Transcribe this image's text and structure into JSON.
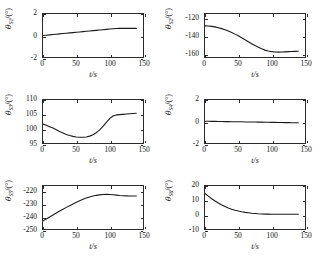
{
  "figure": {
    "rows": 3,
    "cols": 2,
    "xlabel": "t/s",
    "degree_symbol": "°",
    "theta_symbol": "θ"
  },
  "chart_data": [
    {
      "type": "line",
      "id": "theta-s1",
      "title": "",
      "xlabel": "t/s",
      "ylabel": "θS1/(°)",
      "ylabel_base": "θ",
      "ylabel_sub": "S1",
      "ylabel_unit": "/(°)",
      "xlim": [
        0,
        150
      ],
      "ylim": [
        -2,
        2
      ],
      "xticks": [
        0,
        50,
        100,
        150
      ],
      "yticks": [
        2,
        0,
        -2
      ],
      "xtick_labels": [
        "0",
        "50",
        "100",
        "150"
      ],
      "ytick_labels": [
        "2",
        "0",
        "-2"
      ],
      "grid": false,
      "legend": null,
      "x": [
        0,
        5,
        10,
        15,
        20,
        25,
        30,
        35,
        40,
        45,
        50,
        55,
        60,
        65,
        70,
        75,
        80,
        85,
        90,
        95,
        100,
        105,
        110,
        115,
        120,
        125,
        130,
        135,
        140
      ],
      "y": [
        0.0,
        0.03,
        0.06,
        0.09,
        0.12,
        0.15,
        0.18,
        0.21,
        0.24,
        0.27,
        0.3,
        0.33,
        0.36,
        0.39,
        0.42,
        0.45,
        0.48,
        0.51,
        0.54,
        0.57,
        0.6,
        0.63,
        0.65,
        0.66,
        0.66,
        0.66,
        0.66,
        0.66,
        0.66
      ]
    },
    {
      "type": "line",
      "id": "theta-s2",
      "title": "",
      "xlabel": "t/s",
      "ylabel": "θS2/(°)",
      "ylabel_base": "θ",
      "ylabel_sub": "S2",
      "ylabel_unit": "/(°)",
      "xlim": [
        0,
        150
      ],
      "ylim": [
        -165,
        -115
      ],
      "xticks": [
        0,
        50,
        100,
        150
      ],
      "yticks": [
        -120,
        -140,
        -160
      ],
      "xtick_labels": [
        "0",
        "50",
        "100",
        "150"
      ],
      "ytick_labels": [
        "-120",
        "-140",
        "-160"
      ],
      "grid": false,
      "legend": null,
      "x": [
        0,
        5,
        10,
        15,
        20,
        25,
        30,
        35,
        40,
        45,
        50,
        55,
        60,
        65,
        70,
        75,
        80,
        85,
        90,
        95,
        100,
        105,
        110,
        115,
        120,
        125,
        130,
        135,
        140
      ],
      "y": [
        -128.8,
        -129.0,
        -129.4,
        -130.0,
        -130.9,
        -132.0,
        -133.3,
        -134.8,
        -136.5,
        -138.4,
        -140.4,
        -142.6,
        -144.9,
        -147.2,
        -149.5,
        -151.7,
        -153.7,
        -155.5,
        -157.0,
        -158.1,
        -158.8,
        -159.2,
        -159.3,
        -159.2,
        -159.0,
        -158.8,
        -158.6,
        -158.5,
        -158.4
      ]
    },
    {
      "type": "line",
      "id": "theta-s3",
      "title": "",
      "xlabel": "t/s",
      "ylabel": "θS3/(°)",
      "ylabel_base": "θ",
      "ylabel_sub": "S3",
      "ylabel_unit": "/(°)",
      "xlim": [
        0,
        150
      ],
      "ylim": [
        95,
        110
      ],
      "xticks": [
        0,
        50,
        100,
        150
      ],
      "yticks": [
        110,
        105,
        100,
        95
      ],
      "xtick_labels": [
        "0",
        "50",
        "100",
        "150"
      ],
      "ytick_labels": [
        "110",
        "105",
        "100",
        "95"
      ],
      "grid": false,
      "legend": null,
      "x": [
        0,
        5,
        10,
        15,
        20,
        25,
        30,
        35,
        40,
        45,
        50,
        55,
        60,
        65,
        70,
        75,
        80,
        85,
        90,
        95,
        100,
        105,
        110,
        115,
        120,
        125,
        130,
        135,
        140
      ],
      "y": [
        101.6,
        101.2,
        100.7,
        100.2,
        99.6,
        99.0,
        98.5,
        98.0,
        97.6,
        97.3,
        97.1,
        97.0,
        97.0,
        97.1,
        97.4,
        97.9,
        98.6,
        99.6,
        100.8,
        102.2,
        103.5,
        104.4,
        104.8,
        104.9,
        105.0,
        105.1,
        105.2,
        105.3,
        105.4
      ]
    },
    {
      "type": "line",
      "id": "theta-s4",
      "title": "",
      "xlabel": "t/s",
      "ylabel": "θS4/(°)",
      "ylabel_base": "θ",
      "ylabel_sub": "S4",
      "ylabel_unit": "/(°)",
      "xlim": [
        0,
        150
      ],
      "ylim": [
        -2,
        2
      ],
      "xticks": [
        0,
        50,
        100,
        150
      ],
      "yticks": [
        2,
        0,
        -2
      ],
      "xtick_labels": [
        "0",
        "50",
        "100",
        "150"
      ],
      "ytick_labels": [
        "2",
        "0",
        "-2"
      ],
      "grid": false,
      "legend": null,
      "x": [
        0,
        5,
        10,
        15,
        20,
        25,
        30,
        35,
        40,
        45,
        50,
        55,
        60,
        65,
        70,
        75,
        80,
        85,
        90,
        95,
        100,
        105,
        110,
        115,
        120,
        125,
        130,
        135,
        140
      ],
      "y": [
        0.02,
        0.02,
        0.01,
        0.01,
        0.0,
        0.0,
        -0.01,
        -0.01,
        -0.02,
        -0.02,
        -0.03,
        -0.03,
        -0.04,
        -0.04,
        -0.05,
        -0.05,
        -0.06,
        -0.06,
        -0.07,
        -0.07,
        -0.08,
        -0.08,
        -0.09,
        -0.09,
        -0.1,
        -0.1,
        -0.11,
        -0.11,
        -0.12
      ]
    },
    {
      "type": "line",
      "id": "theta-s5",
      "title": "",
      "xlabel": "t/s",
      "ylabel": "θS5/(°)",
      "ylabel_base": "θ",
      "ylabel_sub": "S5",
      "ylabel_unit": "/(°)",
      "xlim": [
        0,
        150
      ],
      "ylim": [
        -250,
        -215
      ],
      "xticks": [
        0,
        50,
        100,
        150
      ],
      "yticks": [
        -220,
        -230,
        -240,
        -250
      ],
      "xtick_labels": [
        "0",
        "50",
        "100",
        "150"
      ],
      "ytick_labels": [
        "-220",
        "-230",
        "-240",
        "-250"
      ],
      "grid": false,
      "legend": null,
      "x": [
        0,
        5,
        10,
        15,
        20,
        25,
        30,
        35,
        40,
        45,
        50,
        55,
        60,
        65,
        70,
        75,
        80,
        85,
        90,
        95,
        100,
        105,
        110,
        115,
        120,
        125,
        130,
        135,
        140
      ],
      "y": [
        -243.4,
        -241.8,
        -240.2,
        -238.6,
        -237.0,
        -235.4,
        -233.9,
        -232.4,
        -231.0,
        -229.6,
        -228.3,
        -227.0,
        -225.8,
        -224.8,
        -223.9,
        -223.2,
        -222.6,
        -222.2,
        -221.9,
        -221.8,
        -221.9,
        -222.1,
        -222.4,
        -222.7,
        -222.9,
        -223.0,
        -223.1,
        -223.1,
        -223.1
      ]
    },
    {
      "type": "line",
      "id": "theta-s6",
      "title": "",
      "xlabel": "t/s",
      "ylabel": "θS6/(°)",
      "ylabel_base": "θ",
      "ylabel_sub": "S6",
      "ylabel_unit": "/(°)",
      "xlim": [
        0,
        150
      ],
      "ylim": [
        -10,
        20
      ],
      "xticks": [
        0,
        50,
        100,
        150
      ],
      "yticks": [
        20,
        10,
        0,
        -10
      ],
      "xtick_labels": [
        "0",
        "50",
        "100",
        "150"
      ],
      "ytick_labels": [
        "20",
        "10",
        "0",
        "-10"
      ],
      "grid": false,
      "legend": null,
      "x": [
        0,
        5,
        10,
        15,
        20,
        25,
        30,
        35,
        40,
        45,
        50,
        55,
        60,
        65,
        70,
        75,
        80,
        85,
        90,
        95,
        100,
        105,
        110,
        115,
        120,
        125,
        130,
        135,
        140
      ],
      "y": [
        14.8,
        12.9,
        11.1,
        9.5,
        8.1,
        6.8,
        5.7,
        4.7,
        3.8,
        3.1,
        2.5,
        2.0,
        1.6,
        1.3,
        1.0,
        0.8,
        0.6,
        0.5,
        0.4,
        0.35,
        0.3,
        0.3,
        0.3,
        0.3,
        0.3,
        0.3,
        0.3,
        0.3,
        0.3
      ]
    }
  ]
}
